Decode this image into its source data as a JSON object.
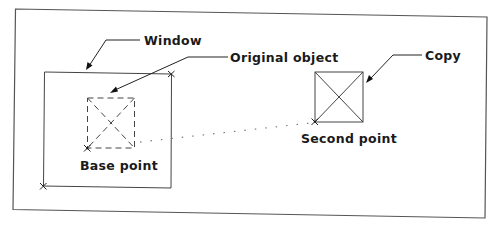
{
  "figure": {
    "type": "AutoCAD COPY command illustration",
    "labels": {
      "window": "Window",
      "original_object": "Original object",
      "copy": "Copy",
      "base_point": "Base point",
      "second_point": "Second point"
    },
    "elements": [
      {
        "id": "outer-frame",
        "kind": "border rectangle"
      },
      {
        "id": "selection-window",
        "kind": "rectangle",
        "label": "Window",
        "corner_markers": [
          "top-right",
          "bottom-left"
        ]
      },
      {
        "id": "original-object",
        "kind": "dashed square with X",
        "label": "Original object",
        "point": "Base point"
      },
      {
        "id": "copy-object",
        "kind": "solid square with X",
        "label": "Copy",
        "point": "Second point"
      },
      {
        "id": "displacement",
        "kind": "dotted line",
        "from": "Base point",
        "to": "Second point"
      }
    ],
    "colors": {
      "background": "#ffffff",
      "lines": "#333333",
      "text": "#1a1a1a"
    }
  }
}
